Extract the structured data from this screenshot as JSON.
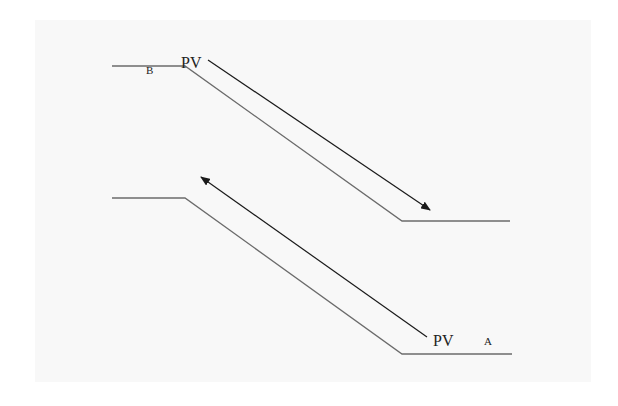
{
  "diagram": {
    "colors": {
      "background": "#ffffff",
      "panel": "#f8f8f8",
      "profile_line": "#6b6b6b",
      "arrow": "#1a1a1a",
      "text": "#222222"
    },
    "profiles": [
      {
        "name": "upper-profile",
        "points": "112,66 185,66 402,221 510,221"
      },
      {
        "name": "lower-profile",
        "points": "112,198 185,198 402,354 512,354"
      }
    ],
    "arrows": [
      {
        "name": "arrow-down-right",
        "x1": 208,
        "y1": 60,
        "x2": 430,
        "y2": 210
      },
      {
        "name": "arrow-up-left",
        "x1": 427,
        "y1": 337,
        "x2": 201,
        "y2": 177
      }
    ],
    "labels": {
      "top_point": "B",
      "top_pv": "PV",
      "bottom_pv": "PV",
      "bottom_point": "A"
    }
  }
}
